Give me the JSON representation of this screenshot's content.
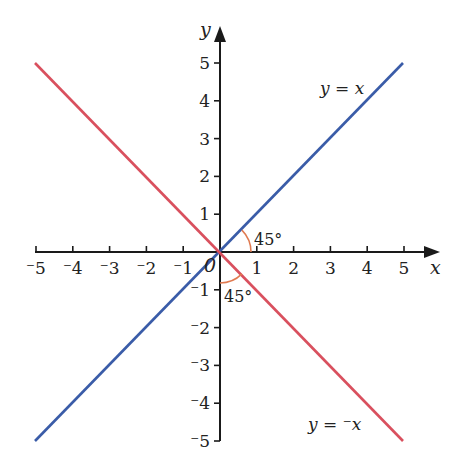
{
  "chart_data": {
    "type": "line",
    "title": "",
    "xlabel": "x",
    "ylabel": "y",
    "xlim": [
      -5,
      5
    ],
    "ylim": [
      -5,
      5
    ],
    "x_ticks": [
      "⁻5",
      "⁻4",
      "⁻3",
      "⁻2",
      "⁻1",
      "1",
      "2",
      "3",
      "4",
      "5"
    ],
    "y_ticks": [
      "5",
      "4",
      "3",
      "2",
      "1",
      "⁻1",
      "⁻2",
      "⁻3",
      "⁻4",
      "⁻5"
    ],
    "origin_label": "0",
    "series": [
      {
        "name": "y = x",
        "color": "#3a5ca8",
        "x": [
          -5,
          5
        ],
        "y": [
          -5,
          5
        ]
      },
      {
        "name": "y = ⁻x",
        "color": "#d9505e",
        "x": [
          -5,
          5
        ],
        "y": [
          5,
          -5
        ]
      }
    ],
    "annotations": [
      {
        "text": "45°",
        "position": "between positive x-axis and y = x"
      },
      {
        "text": "45°",
        "position": "between negative y-axis and y = ⁻x"
      }
    ],
    "grid": false,
    "legend": "none (inline line labels)"
  },
  "labels": {
    "x_axis": "x",
    "y_axis": "y",
    "origin": "0",
    "line_pos_y": "y",
    "line_pos_eq": " = ",
    "line_pos_x": "x",
    "line_neg_y": "y",
    "line_neg_eq": " = ⁻",
    "line_neg_x": "x",
    "angle1": "45°",
    "angle2": "45°"
  },
  "colors": {
    "axis": "#1a1a1a",
    "line_pos": "#3a5ca8",
    "line_neg": "#d9505e",
    "angle_arc": "#e07a50"
  }
}
